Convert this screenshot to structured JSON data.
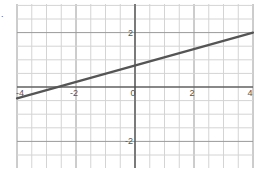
{
  "marker": ".",
  "chart_data": {
    "type": "line",
    "title": "",
    "xlabel": "",
    "ylabel": "",
    "xlim": [
      -4,
      4
    ],
    "ylim": [
      -3,
      3
    ],
    "grid": true,
    "grid_minor_step": 0.5,
    "x_ticks": [
      -4,
      -2,
      0,
      2,
      4
    ],
    "x_tick_labels": [
      "-4",
      "-2",
      "0",
      "2",
      "4"
    ],
    "y_ticks": [
      2,
      -2
    ],
    "y_tick_labels": [
      "2",
      "-2"
    ],
    "series": [
      {
        "name": "line",
        "x": [
          -4,
          4
        ],
        "y": [
          -0.42,
          2.0
        ],
        "slope": 0.3,
        "intercept": 0.78,
        "color": "#555555"
      }
    ],
    "colors": {
      "grid_minor": "#d4d4d4",
      "grid_major": "#9a9a9a",
      "axis": "#444444",
      "label": "#555555"
    }
  }
}
